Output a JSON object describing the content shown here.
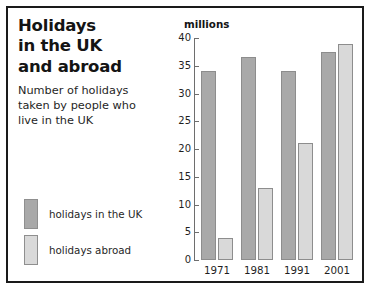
{
  "figure": {
    "title_lines": [
      "Holidays",
      "in the UK",
      "and abroad"
    ],
    "subtitle": "Number of holidays taken by people who live in the UK",
    "units_label": "millions",
    "border_color": "#1a1a1a",
    "background": "#ffffff"
  },
  "legend": {
    "items": [
      {
        "label": "holidays in the UK",
        "color": "#a9a9a9"
      },
      {
        "label": "holidays abroad",
        "color": "#d9d9d9"
      }
    ]
  },
  "chart_data": {
    "type": "bar",
    "subtitle": "Number of holidays taken by people who live in the UK",
    "xlabel": "",
    "ylabel": "millions",
    "ylim": [
      0,
      40
    ],
    "yticks": [
      0,
      5,
      10,
      15,
      20,
      25,
      30,
      35,
      40
    ],
    "ytick_labels": [
      "0",
      "5",
      "10",
      "15",
      "20",
      "25",
      "30",
      "35",
      "40"
    ],
    "grid": false,
    "legend_position": "left",
    "categories": [
      "1971",
      "1981",
      "1991",
      "2001"
    ],
    "series": [
      {
        "name": "holidays in the UK",
        "color": "#a9a9a9",
        "values": [
          34,
          36.5,
          34,
          37.5
        ]
      },
      {
        "name": "holidays abroad",
        "color": "#d9d9d9",
        "values": [
          4,
          13,
          21,
          39
        ]
      }
    ]
  }
}
